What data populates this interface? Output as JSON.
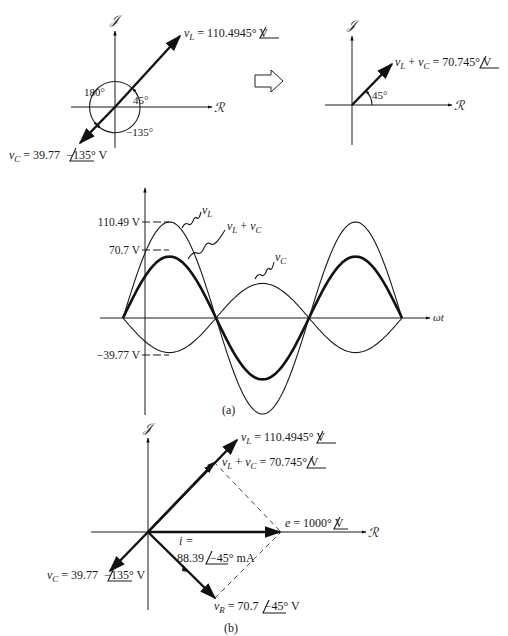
{
  "figure": {
    "colors": {
      "ink": "#111111",
      "background": "#ffffff"
    },
    "axis_labels": {
      "imag": "𝒥",
      "real": "ℛ",
      "time": "ωt"
    },
    "top_left_phasor": {
      "vL_label": {
        "name": "v",
        "sub": "L",
        "value": " = 110.49",
        "angle": "45°",
        "unit": " V"
      },
      "vC_label": {
        "name": "v",
        "sub": "C",
        "value": " = 39.77",
        "angle": "−135°",
        "unit": " V"
      },
      "angle_180": "180°",
      "angle_45": "45°",
      "angle_m135": "−135°"
    },
    "transform_arrow": "block-arrow-right",
    "top_right_phasor": {
      "sum_label": {
        "name1": "v",
        "sub1": "L",
        "plus": " + ",
        "name2": "v",
        "sub2": "C",
        "value": " = 70.7",
        "angle": "45°",
        "unit": " V"
      },
      "angle_45": "45°"
    },
    "waveform": {
      "tick_labels": {
        "vL_peak": "110.49 V",
        "sum_peak": "70.7 V",
        "vC_trough": "−39.77 V"
      },
      "curve_labels": {
        "vL": {
          "name": "v",
          "sub": "L"
        },
        "sum": {
          "name1": "v",
          "sub1": "L",
          "plus": " + ",
          "name2": "v",
          "sub2": "C"
        },
        "vC": {
          "name": "v",
          "sub": "C"
        }
      },
      "caption": "(a)"
    },
    "bottom_phasor": {
      "vL_label": {
        "name": "v",
        "sub": "L",
        "value": " = 110.49",
        "angle": "45°",
        "unit": " V"
      },
      "sum_label": {
        "name1": "v",
        "sub1": "L",
        "plus": " + ",
        "name2": "v",
        "sub2": "C",
        "value": " = 70.7",
        "angle": "45°",
        "unit": " V"
      },
      "e_label": {
        "name": "e",
        "value": " = 100",
        "angle": "0°",
        "unit": " V"
      },
      "i_label_line1": "i =",
      "i_label_line2": {
        "value": "88.39",
        "angle": "−45°",
        "unit": " mA"
      },
      "vC_label": {
        "name": "v",
        "sub": "C",
        "value": " = 39.77",
        "angle": "−135°",
        "unit": " V"
      },
      "vR_label": {
        "name": "v",
        "sub": "R",
        "value": " = 70.7",
        "angle": "−45°",
        "unit": " V"
      },
      "caption": "(b)"
    }
  },
  "chart_data": {
    "type": "line",
    "title": "",
    "xlabel": "ωt",
    "ylabel": "",
    "x": [
      "0",
      "π/2",
      "π",
      "3π/2",
      "2π",
      "5π/2",
      "3π"
    ],
    "series": [
      {
        "name": "vL",
        "amplitude": 110.49,
        "phase_deg": 45,
        "values": [
          0,
          110.49,
          0,
          -110.49,
          0,
          110.49,
          0
        ]
      },
      {
        "name": "vL + vC",
        "amplitude": 70.7,
        "phase_deg": 45,
        "values": [
          0,
          70.7,
          0,
          -70.7,
          0,
          70.7,
          0
        ]
      },
      {
        "name": "vC",
        "amplitude": 39.77,
        "phase_deg": -135,
        "values": [
          0,
          -39.77,
          0,
          39.77,
          0,
          -39.77,
          0
        ]
      }
    ],
    "y_ticks": [
      110.49,
      70.7,
      -39.77
    ],
    "grid": false,
    "legend": "inline labels"
  }
}
